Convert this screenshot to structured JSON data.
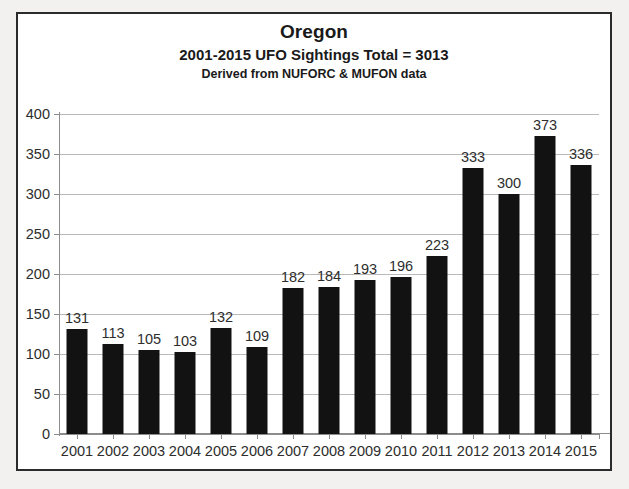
{
  "chart_data": {
    "type": "bar",
    "title": "Oregon",
    "subtitle": "2001-2015 UFO Sightings  Total = 3013",
    "source_note": "Derived from NUFORC & MUFON data",
    "xlabel": "",
    "ylabel": "",
    "categories": [
      "2001",
      "2002",
      "2003",
      "2004",
      "2005",
      "2006",
      "2007",
      "2008",
      "2009",
      "2010",
      "2011",
      "2012",
      "2013",
      "2014",
      "2015"
    ],
    "values": [
      131,
      113,
      105,
      103,
      132,
      109,
      182,
      184,
      193,
      196,
      223,
      333,
      300,
      373,
      336
    ],
    "ylim": [
      0,
      400
    ],
    "ytick_values": [
      0,
      50,
      100,
      150,
      200,
      250,
      300,
      350,
      400
    ],
    "ytick_labels": [
      "0",
      "50",
      "100",
      "150",
      "200",
      "250",
      "300",
      "350",
      "400"
    ],
    "grid": true,
    "legend": false,
    "data_labels": true,
    "bar_color": "#121212",
    "grid_color": "#b9b9b9",
    "axis_color": "#8c8c8c",
    "border_color": "#2b2b2b",
    "plot_background": "#ffffff",
    "total": 3013
  }
}
